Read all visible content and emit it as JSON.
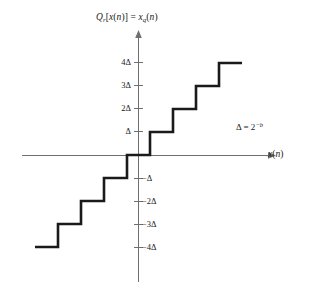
{
  "figure": {
    "annotation": "Δ = 2^−b",
    "x_axis_label": "x(n)",
    "background_color": "#ffffff",
    "curve_color": "#1a1a1a",
    "axis_color": "#6f6f6f"
  },
  "axes": {
    "y_tick_labels": [
      "4Δ",
      "3Δ",
      "2Δ",
      "Δ",
      "−Δ",
      "−2Δ",
      "−3Δ",
      "−4Δ"
    ],
    "y_tick_values": [
      4,
      3,
      2,
      1,
      -1,
      -2,
      -3,
      -4
    ],
    "x_range": [
      -4.5,
      4.5
    ],
    "y_range": [
      -4.5,
      4.5
    ],
    "grid": false,
    "x_tick_labels": [],
    "origin_label": ""
  },
  "chart_data": {
    "type": "line",
    "subtitle": "",
    "xlabel": "x(n)",
    "ylabel": "Q_r[x(n)] = x_q(n)",
    "xlim": [
      -4.5,
      4.5
    ],
    "ylim": [
      -4.5,
      4.5
    ],
    "grid": false,
    "legend": "none",
    "annotations": [
      "Δ = 2^−b"
    ],
    "series": [
      {
        "name": "Q_r[x(n)]",
        "style": "staircase",
        "x": [
          -4.5,
          -3.5,
          -3.5,
          -2.5,
          -2.5,
          -1.5,
          -1.5,
          -0.5,
          -0.5,
          0.5,
          0.5,
          1.5,
          1.5,
          2.5,
          2.5,
          3.5,
          3.5,
          4.5
        ],
        "values": [
          -4,
          -4,
          -3,
          -3,
          -2,
          -2,
          -1,
          -1,
          0,
          0,
          1,
          1,
          2,
          2,
          3,
          3,
          4,
          4
        ]
      }
    ],
    "steps": [
      {
        "level": -4,
        "x_start": -4.5,
        "x_end": -3.5,
        "label": "−4Δ"
      },
      {
        "level": -3,
        "x_start": -3.5,
        "x_end": -2.5,
        "label": "−3Δ"
      },
      {
        "level": -2,
        "x_start": -2.5,
        "x_end": -1.5,
        "label": "−2Δ"
      },
      {
        "level": -1,
        "x_start": -1.5,
        "x_end": -0.5,
        "label": "−Δ"
      },
      {
        "level": 0,
        "x_start": -0.5,
        "x_end": 0.5,
        "label": "0"
      },
      {
        "level": 1,
        "x_start": 0.5,
        "x_end": 1.5,
        "label": "Δ"
      },
      {
        "level": 2,
        "x_start": 1.5,
        "x_end": 2.5,
        "label": "2Δ"
      },
      {
        "level": 3,
        "x_start": 2.5,
        "x_end": 3.5,
        "label": "3Δ"
      },
      {
        "level": 4,
        "x_start": 3.5,
        "x_end": 4.5,
        "label": "4Δ"
      }
    ]
  }
}
